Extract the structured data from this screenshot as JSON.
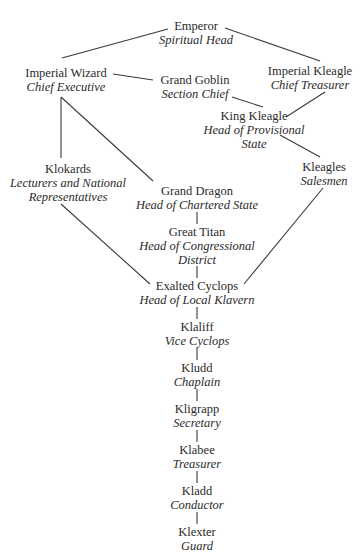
{
  "diagram": {
    "type": "organizational-hierarchy",
    "nodes": {
      "emperor": {
        "title": "Emperor",
        "role": "Spiritual Head"
      },
      "imperial_wizard": {
        "title": "Imperial Wizard",
        "role": "Chief Executive"
      },
      "grand_goblin": {
        "title": "Grand Goblin",
        "role": "Section Chief"
      },
      "imperial_kleagle": {
        "title": "Imperial Kleagle",
        "role": "Chief Treasurer"
      },
      "king_kleagle": {
        "title": "King Kleagle",
        "role_line1": "Head of Provisional",
        "role_line2": "State"
      },
      "klokards": {
        "title": "Klokards",
        "role_line1": "Lecturers and National",
        "role_line2": "Representatives"
      },
      "kleagles": {
        "title": "Kleagles",
        "role": "Salesmen"
      },
      "grand_dragon": {
        "title": "Grand Dragon",
        "role": "Head of Chartered State"
      },
      "great_titan": {
        "title": "Great Titan",
        "role_line1": "Head of Congressional",
        "role_line2": "District"
      },
      "exalted_cyclops": {
        "title": "Exalted Cyclops",
        "role": "Head of Local Klavern"
      },
      "klaliff": {
        "title": "Klaliff",
        "role": "Vice Cyclops"
      },
      "kludd": {
        "title": "Kludd",
        "role": "Chaplain"
      },
      "kligrapp": {
        "title": "Kligrapp",
        "role": "Secretary"
      },
      "klabee": {
        "title": "Klabee",
        "role": "Treasurer"
      },
      "kladd": {
        "title": "Kladd",
        "role": "Conductor"
      },
      "klexter": {
        "title": "Klexter",
        "role": "Guard"
      }
    },
    "edges": [
      [
        "emperor",
        "imperial_wizard"
      ],
      [
        "emperor",
        "imperial_kleagle"
      ],
      [
        "imperial_wizard",
        "grand_goblin"
      ],
      [
        "grand_goblin",
        "king_kleagle"
      ],
      [
        "imperial_kleagle",
        "king_kleagle"
      ],
      [
        "imperial_wizard",
        "klokards"
      ],
      [
        "imperial_wizard",
        "grand_dragon"
      ],
      [
        "king_kleagle",
        "kleagles"
      ],
      [
        "grand_dragon",
        "great_titan"
      ],
      [
        "great_titan",
        "exalted_cyclops"
      ],
      [
        "klokards",
        "exalted_cyclops"
      ],
      [
        "kleagles",
        "exalted_cyclops"
      ],
      [
        "exalted_cyclops",
        "klaliff"
      ],
      [
        "klaliff",
        "kludd"
      ],
      [
        "kludd",
        "kligrapp"
      ],
      [
        "kligrapp",
        "klabee"
      ],
      [
        "klabee",
        "kladd"
      ],
      [
        "kladd",
        "klexter"
      ]
    ]
  }
}
